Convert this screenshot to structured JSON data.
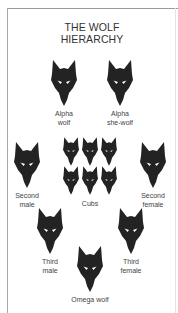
{
  "title": {
    "line1": "THE WOLF",
    "line2": "HIERARCHY"
  },
  "colors": {
    "wolf": "#232323",
    "eye": "#ffffff",
    "frame": "#9a9a9a",
    "text": "#444444"
  },
  "nodes": {
    "alpha_wolf": {
      "line1": "Alpha",
      "line2": "wolf"
    },
    "alpha_she_wolf": {
      "line1": "Alpha",
      "line2": "she-wolf"
    },
    "second_male": {
      "line1": "Second",
      "line2": "male"
    },
    "cubs": {
      "line1": "Cubs",
      "count": 6
    },
    "second_female": {
      "line1": "Second",
      "line2": "female"
    },
    "third_male": {
      "line1": "Third",
      "line2": "male"
    },
    "third_female": {
      "line1": "Third",
      "line2": "female"
    },
    "omega_wolf": {
      "line1": "Omega wolf"
    }
  }
}
